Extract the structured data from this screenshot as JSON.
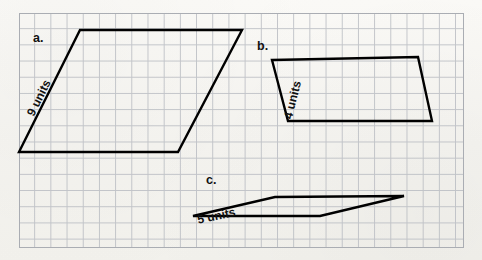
{
  "page": {
    "kind": "geometry-worksheet",
    "background_color": "#f7f6f2",
    "grid_line_color": "#b9bcc2",
    "grid_border_color": "#aaadb3",
    "shape_stroke_color": "#000000",
    "text_color": "#111111"
  },
  "grid": {
    "left": 19,
    "top": 13,
    "width": 445,
    "height": 235,
    "cell_size": 16.2,
    "columns": 27,
    "rows": 14
  },
  "shapes": [
    {
      "id": "a",
      "letter": "a.",
      "side_label": "9 units",
      "side_label_rotation_deg": -63.5,
      "points": "80,30 242,30 178,152 19,152"
    },
    {
      "id": "b",
      "letter": "b.",
      "side_label": "4 units",
      "side_label_rotation_deg": -76,
      "points": "272,60 418,57 432,121 288,121"
    },
    {
      "id": "c",
      "letter": "c.",
      "side_label": "5 units",
      "side_label_rotation_deg": -12,
      "points": "275,197 404,196 320,216 193,216"
    }
  ]
}
